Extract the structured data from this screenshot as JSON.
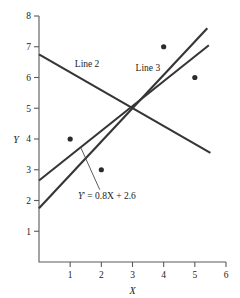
{
  "chart_data": {
    "type": "scatter",
    "title": "",
    "xlabel": "X",
    "ylabel": "Y",
    "xlim": [
      0,
      6
    ],
    "ylim": [
      0,
      8
    ],
    "grid": false,
    "legend_position": "inline-annotations",
    "x_ticks": [
      "1",
      "2",
      "3",
      "4",
      "5",
      "6"
    ],
    "x_tick_values": [
      1,
      2,
      3,
      4,
      5,
      6
    ],
    "y_ticks": [
      "1",
      "2",
      "3",
      "4",
      "5",
      "6",
      "7",
      "8"
    ],
    "y_tick_values": [
      1,
      2,
      3,
      4,
      5,
      6,
      7,
      8
    ],
    "points": [
      {
        "x": 1,
        "y": 4
      },
      {
        "x": 2,
        "y": 3
      },
      {
        "x": 4,
        "y": 7
      },
      {
        "x": 5,
        "y": 6
      }
    ],
    "series": [
      {
        "name": "Line 2",
        "label": "Line 2",
        "kind": "line",
        "slope": -0.6,
        "intercept": 6.75,
        "x_start": 0,
        "x_end": 5.5,
        "y_start": 6.75,
        "y_end": 3.55,
        "label_x": 1.15,
        "label_y": 6.35
      },
      {
        "name": "Line 3",
        "label": "Line 3",
        "kind": "line",
        "slope": 1.08,
        "intercept": 1.75,
        "x_start": 0,
        "x_end": 5.4,
        "y_start": 1.75,
        "y_end": 7.6,
        "label_x": 3.1,
        "label_y": 6.2
      },
      {
        "name": "regression-line",
        "label": "Y' = 0.8X + 2.6",
        "kind": "line",
        "slope": 0.8,
        "intercept": 2.65,
        "x_start": 0,
        "x_end": 5.45,
        "y_start": 2.65,
        "y_end": 7.05,
        "label_x": 1.25,
        "label_y": 2.05
      }
    ],
    "annotations": [
      {
        "text": "Y' = 0.8X + 2.6",
        "text_prefix_italic": "Y",
        "text_rest": "' = 0.8X + 2.6",
        "x": 1.25,
        "y": 2.05,
        "leader_from_x": 1.35,
        "leader_from_y": 3.7,
        "leader_to_x": 1.95,
        "leader_to_y": 2.35
      }
    ],
    "axis_color": "#5a5a5a",
    "line_color": "#353535",
    "point_color": "#2b2b2b",
    "background_color": "#ffffff"
  },
  "axes": {
    "y_axis_title": "Y",
    "x_axis_title": "X"
  }
}
